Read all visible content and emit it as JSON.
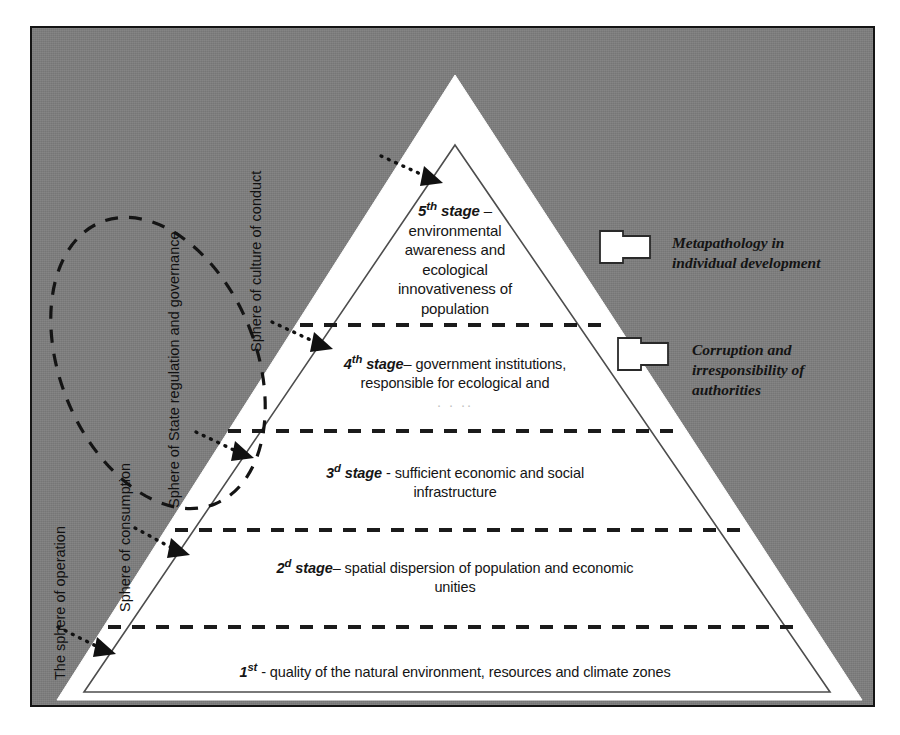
{
  "figure": {
    "type": "pyramid-hierarchy-diagram",
    "background_color": "#7d7d7d",
    "pyramid_fill": "#ffffff",
    "border_color": "#141414"
  },
  "pyramid": {
    "levels": [
      {
        "index": 5,
        "ordinal": "5",
        "ordinal_suffix": "th",
        "label_lead": "stage",
        "dash": "–",
        "lines": [
          "environmental",
          "awareness and",
          "ecological",
          "innovativeness of",
          "population"
        ]
      },
      {
        "index": 4,
        "ordinal": "4",
        "ordinal_suffix": "th",
        "label_lead": "stage",
        "dash": "–",
        "lines": [
          "government institutions,",
          "responsible for ecological and",
          ". . .."
        ]
      },
      {
        "index": 3,
        "ordinal": "3",
        "ordinal_suffix": "d",
        "label_lead": "stage",
        "dash": "-",
        "lines": [
          "sufficient economic and social",
          "infrastructure"
        ]
      },
      {
        "index": 2,
        "ordinal": "2",
        "ordinal_suffix": "d",
        "label_lead": "stage",
        "dash": "–",
        "lines": [
          "spatial dispersion of population and economic",
          "unities"
        ]
      },
      {
        "index": 1,
        "ordinal": "1",
        "ordinal_suffix": "st",
        "label_lead": "",
        "dash": "-",
        "lines": [
          "quality of the natural environment, resources and climate zones"
        ]
      }
    ]
  },
  "sphere_labels": [
    {
      "id": "operation",
      "text": "The sphere of operation"
    },
    {
      "id": "consumption",
      "text": "Sphere of consumption"
    },
    {
      "id": "state-regulation",
      "text": "Sphere of State regulation and governance"
    },
    {
      "id": "culture-of-conduct",
      "text": "Sphere of culture of conduct"
    }
  ],
  "callouts": [
    {
      "id": "metapathology",
      "lines": [
        "Metapathology in",
        "individual development"
      ],
      "arrow": "left-arrow-icon"
    },
    {
      "id": "corruption",
      "lines": [
        "Corruption and",
        "irresponsibility of",
        "authorities"
      ],
      "arrow": "left-arrow-icon"
    }
  ],
  "connectors": {
    "dotted_arrows": 4,
    "dashed_ellipse": 1,
    "dashed_dividers": 4
  }
}
